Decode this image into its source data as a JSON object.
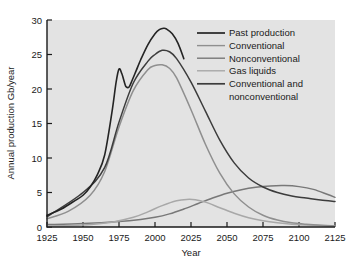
{
  "figure": {
    "background_color": "#ffffff",
    "plot_background_color": "#e3e3e3",
    "frame_color": "#1a1a1a"
  },
  "chart_data": {
    "type": "line",
    "title": "",
    "xlabel": "Year",
    "ylabel": "Annual production Gb/year",
    "xlim": [
      1925,
      2125
    ],
    "ylim": [
      0,
      30
    ],
    "xticks": [
      1925,
      1950,
      1975,
      2000,
      2025,
      2050,
      2075,
      2100,
      2125
    ],
    "yticks": [
      0,
      5,
      10,
      15,
      20,
      25,
      30
    ],
    "xtick_labels": [
      "1925",
      "1950",
      "1975",
      "2000",
      "2025",
      "2050",
      "2075",
      "2100",
      "2125"
    ],
    "ytick_labels": [
      "0",
      "5",
      "10",
      "15",
      "20",
      "25",
      "30"
    ],
    "grid": false,
    "legend_position": "upper right",
    "series": [
      {
        "name": "Past production",
        "color": "#242424",
        "width": 1.6,
        "x": [
          1925,
          1935,
          1945,
          1950,
          1955,
          1960,
          1965,
          1970,
          1973,
          1975,
          1977,
          1979,
          1980,
          1982,
          1984,
          1987,
          1990,
          1995,
          2000,
          2003,
          2006,
          2008,
          2012,
          2016,
          2020
        ],
        "y": [
          1.7,
          2.6,
          3.9,
          4.6,
          5.8,
          7.6,
          10.4,
          16.5,
          21.0,
          22.9,
          22.2,
          20.8,
          20.3,
          20.3,
          21.2,
          22.7,
          24.2,
          26.4,
          28.0,
          28.6,
          28.8,
          28.7,
          28.0,
          26.6,
          24.4
        ]
      },
      {
        "name": "Conventional",
        "color": "#8f8f8f",
        "width": 1.5,
        "x": [
          1925,
          1940,
          1955,
          1965,
          1975,
          1985,
          1995,
          2000,
          2005,
          2010,
          2015,
          2025,
          2035,
          2045,
          2055,
          2065,
          2075,
          2085,
          2095,
          2105,
          2115,
          2125
        ],
        "y": [
          1.2,
          2.3,
          4.6,
          8.0,
          14.5,
          19.8,
          22.8,
          23.4,
          23.5,
          23.0,
          21.6,
          17.0,
          12.0,
          7.8,
          4.8,
          2.9,
          1.7,
          1.0,
          0.6,
          0.4,
          0.25,
          0.15
        ]
      },
      {
        "name": "Nonconventional",
        "color": "#787878",
        "width": 1.5,
        "x": [
          1925,
          1950,
          1975,
          1990,
          2000,
          2010,
          2020,
          2030,
          2040,
          2050,
          2060,
          2070,
          2080,
          2090,
          2100,
          2110,
          2120,
          2125
        ],
        "y": [
          0.35,
          0.5,
          0.8,
          1.1,
          1.4,
          1.9,
          2.6,
          3.4,
          4.2,
          4.9,
          5.4,
          5.75,
          5.95,
          6.0,
          5.85,
          5.45,
          4.7,
          4.3
        ]
      },
      {
        "name": "Gas liquids",
        "color": "#a8a8a8",
        "width": 1.5,
        "x": [
          1925,
          1950,
          1970,
          1985,
          1995,
          2005,
          2015,
          2022,
          2028,
          2035,
          2045,
          2055,
          2065,
          2075,
          2085,
          2095,
          2110,
          2125
        ],
        "y": [
          0.15,
          0.3,
          0.7,
          1.4,
          2.2,
          3.1,
          3.8,
          4.0,
          3.95,
          3.6,
          2.8,
          2.0,
          1.35,
          0.9,
          0.6,
          0.4,
          0.25,
          0.15
        ]
      },
      {
        "name": "Conventional and nonconventional",
        "color": "#3c3c3c",
        "width": 1.5,
        "x": [
          1925,
          1950,
          1965,
          1975,
          1985,
          1995,
          2000,
          2005,
          2010,
          2015,
          2025,
          2035,
          2045,
          2055,
          2065,
          2075,
          2085,
          2095,
          2105,
          2115,
          2125
        ],
        "y": [
          1.5,
          5.0,
          8.6,
          15.2,
          20.9,
          24.0,
          25.0,
          25.6,
          25.4,
          24.4,
          21.0,
          16.8,
          12.6,
          9.3,
          7.1,
          5.8,
          5.0,
          4.5,
          4.2,
          3.9,
          3.7
        ]
      }
    ]
  },
  "legend": {
    "entries": [
      {
        "label": "Past production",
        "color": "#242424"
      },
      {
        "label": "Conventional",
        "color": "#8f8f8f"
      },
      {
        "label": "Nonconventional",
        "color": "#787878"
      },
      {
        "label": "Gas liquids",
        "color": "#a8a8a8"
      },
      {
        "label": "Conventional and",
        "color": "#3c3c3c"
      },
      {
        "label": "nonconventional",
        "color": ""
      }
    ]
  }
}
